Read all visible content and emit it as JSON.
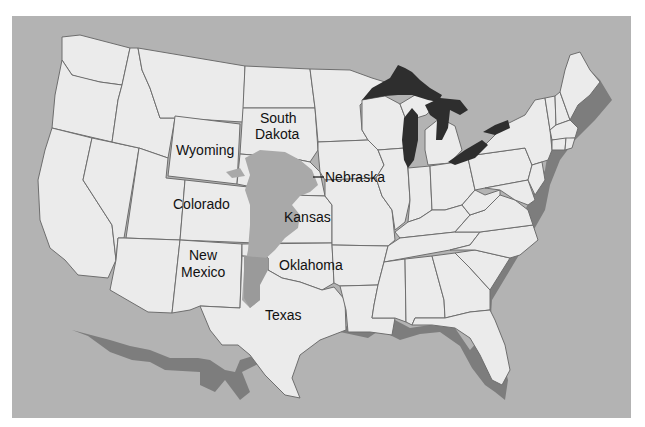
{
  "map": {
    "title": "",
    "colors": {
      "ocean": "#b3b3b3",
      "land": "#ebebeb",
      "border": "#6e6e6e",
      "aquifer": "#a9a9a9",
      "coastal_shelf": "#7d7d7d",
      "great_lakes": "#2e2e2e",
      "label_text": "#111111"
    },
    "labels": [
      {
        "id": "south-dakota",
        "lines": [
          "South",
          "Dakota"
        ]
      },
      {
        "id": "wyoming",
        "lines": [
          "Wyoming"
        ]
      },
      {
        "id": "nebraska",
        "lines": [
          "Nebraska"
        ],
        "leader_line": true
      },
      {
        "id": "colorado",
        "lines": [
          "Colorado"
        ]
      },
      {
        "id": "kansas",
        "lines": [
          "Kansas"
        ]
      },
      {
        "id": "new-mexico",
        "lines": [
          "New",
          "Mexico"
        ]
      },
      {
        "id": "oklahoma",
        "lines": [
          "Oklahoma"
        ]
      },
      {
        "id": "texas",
        "lines": [
          "Texas"
        ]
      }
    ],
    "features": [
      "contiguous-united-states",
      "state-boundaries",
      "great-lakes",
      "shaded-aquifer-region",
      "shaded-coastal-shelf"
    ]
  }
}
